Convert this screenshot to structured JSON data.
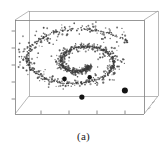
{
  "figure": {
    "caption": "(a)",
    "panel_label": "(a)",
    "background_color": "#ffffff",
    "frame_color": "#8a8a8a",
    "point_color": "#4a4a4a",
    "highlight_color": "#141414"
  },
  "chart_data": {
    "type": "scatter",
    "title": "",
    "subtitle": "",
    "xlabel": "",
    "ylabel": "",
    "zlabel": "",
    "projection": "3d",
    "grid": false,
    "box": true,
    "legend": null,
    "tick_labels": {
      "x": [
        "",
        "",
        "",
        ""
      ],
      "y": [
        "",
        "",
        "",
        "",
        ""
      ],
      "z": [
        "",
        "",
        ""
      ]
    },
    "xlim": [
      0,
      1
    ],
    "ylim": [
      0,
      1
    ],
    "zlim": [
      0,
      1
    ],
    "n_points": 620,
    "noise_sigma": 0.022,
    "spiral": {
      "turns": 1.85,
      "theta_start": 0.35,
      "theta_end": 12.0,
      "radius_start": 0.07,
      "radius_end": 0.47,
      "center_x": 0.5,
      "center_y": 0.5,
      "aspect_y": 0.72,
      "z_slope": 0.18
    },
    "highlight_points": [
      {
        "x": 0.515,
        "y": 0.845,
        "r": 2.6
      },
      {
        "x": 0.375,
        "y": 0.655,
        "r": 2.3
      },
      {
        "x": 0.578,
        "y": 0.638,
        "r": 2.2
      },
      {
        "x": 0.862,
        "y": 0.775,
        "r": 3.0
      }
    ],
    "series": [
      {
        "name": "spiral samples",
        "marker": "dot",
        "color": "#4a4a4a",
        "size": 1.1
      }
    ]
  },
  "axes": {
    "x_ticks": 4,
    "y_ticks": 5,
    "z_ticks": 3,
    "tick_length": 3.2
  }
}
